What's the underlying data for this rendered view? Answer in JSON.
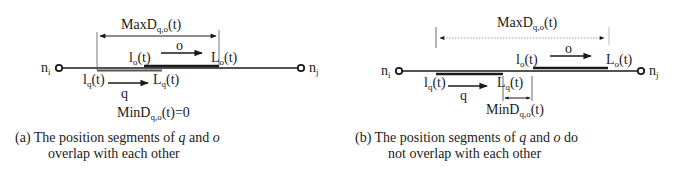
{
  "panels": [
    {
      "id": "a",
      "node_left": {
        "base": "n",
        "sub": "i"
      },
      "node_right": {
        "base": "n",
        "sub": "j"
      },
      "max_label": {
        "base": "MaxD",
        "sub": "q,o",
        "tail": "(t)"
      },
      "min_label": {
        "base": "MinD",
        "sub": "q,o",
        "tail": "(t)=0"
      },
      "o_start": {
        "base": "l",
        "sub": "o",
        "tail": "(t)"
      },
      "o_end": {
        "base": "L",
        "sub": "o",
        "tail": "(t)"
      },
      "o_name": "o",
      "q_start": {
        "base": "l",
        "sub": "q",
        "tail": "(t)"
      },
      "q_end": {
        "base": "L",
        "sub": "q",
        "tail": "(t)"
      },
      "q_name": "q",
      "caption_prefix": "(a) The position segments of ",
      "caption_var1": "q",
      "caption_mid": " and ",
      "caption_var2": "o",
      "caption_line2": "overlap with each other"
    },
    {
      "id": "b",
      "node_left": {
        "base": "n",
        "sub": "i"
      },
      "node_right": {
        "base": "n",
        "sub": "j"
      },
      "max_label": {
        "base": "MaxD",
        "sub": "q,o",
        "tail": "(t)"
      },
      "min_label": {
        "base": "MinD",
        "sub": "q,o",
        "tail": "(t)"
      },
      "o_start": {
        "base": "l",
        "sub": "o",
        "tail": "(t)"
      },
      "o_end": {
        "base": "L",
        "sub": "o",
        "tail": "(t)"
      },
      "o_name": "o",
      "q_start": {
        "base": "l",
        "sub": "q",
        "tail": "(t)"
      },
      "q_end": {
        "base": "L",
        "sub": "q",
        "tail": "(t)"
      },
      "q_name": "q",
      "caption_prefix": "(b) The position segments of ",
      "caption_var1": "q",
      "caption_mid": " and ",
      "caption_var2": "o",
      "caption_suffix": " do",
      "caption_line2": "not overlap with each other"
    }
  ]
}
